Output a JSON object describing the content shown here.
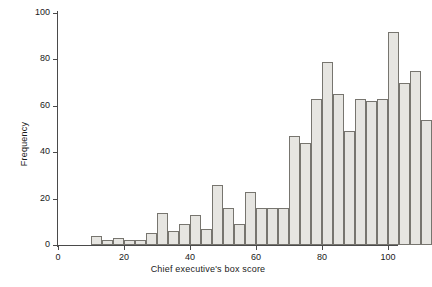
{
  "chart_data": {
    "type": "bar",
    "title": "",
    "xlabel": "Chief executive's box score",
    "ylabel": "Frequency",
    "xlim": [
      0,
      103
    ],
    "ylim": [
      0,
      100
    ],
    "xticks": [
      0,
      20,
      40,
      60,
      80,
      100
    ],
    "yticks": [
      0,
      20,
      40,
      60,
      80,
      100
    ],
    "grid": false,
    "legend": null,
    "bin_width": 3.33,
    "bin_starts": [
      10.0,
      13.33,
      16.67,
      20.0,
      23.33,
      26.67,
      30.0,
      33.33,
      36.67,
      40.0,
      43.33,
      46.67,
      50.0,
      53.33,
      56.67,
      60.0,
      63.33,
      66.67,
      70.0,
      73.33,
      76.67,
      80.0,
      83.33,
      86.67,
      90.0,
      93.33,
      96.67
    ],
    "categories": [
      "10-13.3",
      "13.3-16.7",
      "16.7-20",
      "20-23.3",
      "23.3-26.7",
      "26.7-30",
      "30-33.3",
      "33.3-36.7",
      "36.7-40",
      "40-43.3",
      "43.3-46.7",
      "46.7-50",
      "50-53.3",
      "53.3-56.7",
      "56.7-60",
      "60-63.3",
      "63.3-66.7",
      "66.7-70",
      "70-73.3",
      "73.3-76.7",
      "76.7-80",
      "80-83.3",
      "83.3-86.7",
      "86.7-90",
      "90-93.3",
      "93.3-96.7",
      "96.7-100"
    ],
    "values": [
      4,
      2,
      3,
      2,
      2,
      5,
      14,
      6,
      9,
      13,
      7,
      26,
      16,
      9,
      23,
      16,
      16,
      16,
      47,
      44,
      63,
      79,
      65,
      49,
      63,
      62,
      63
    ],
    "values_right": [
      92,
      70,
      75,
      54
    ]
  },
  "axes": {
    "y_label": "Frequency",
    "x_label": "Chief executive's box score",
    "y_tick_labels": [
      "0",
      "20",
      "40",
      "60",
      "80",
      "100"
    ],
    "x_tick_labels": [
      "0",
      "20",
      "40",
      "60",
      "80",
      "100"
    ]
  },
  "style": {
    "bar_fill": "#e6e5e1",
    "bar_stroke": "#77756f",
    "axis_color": "#4a4a4a",
    "text_color": "#1a1a1a",
    "background": "#ffffff"
  }
}
